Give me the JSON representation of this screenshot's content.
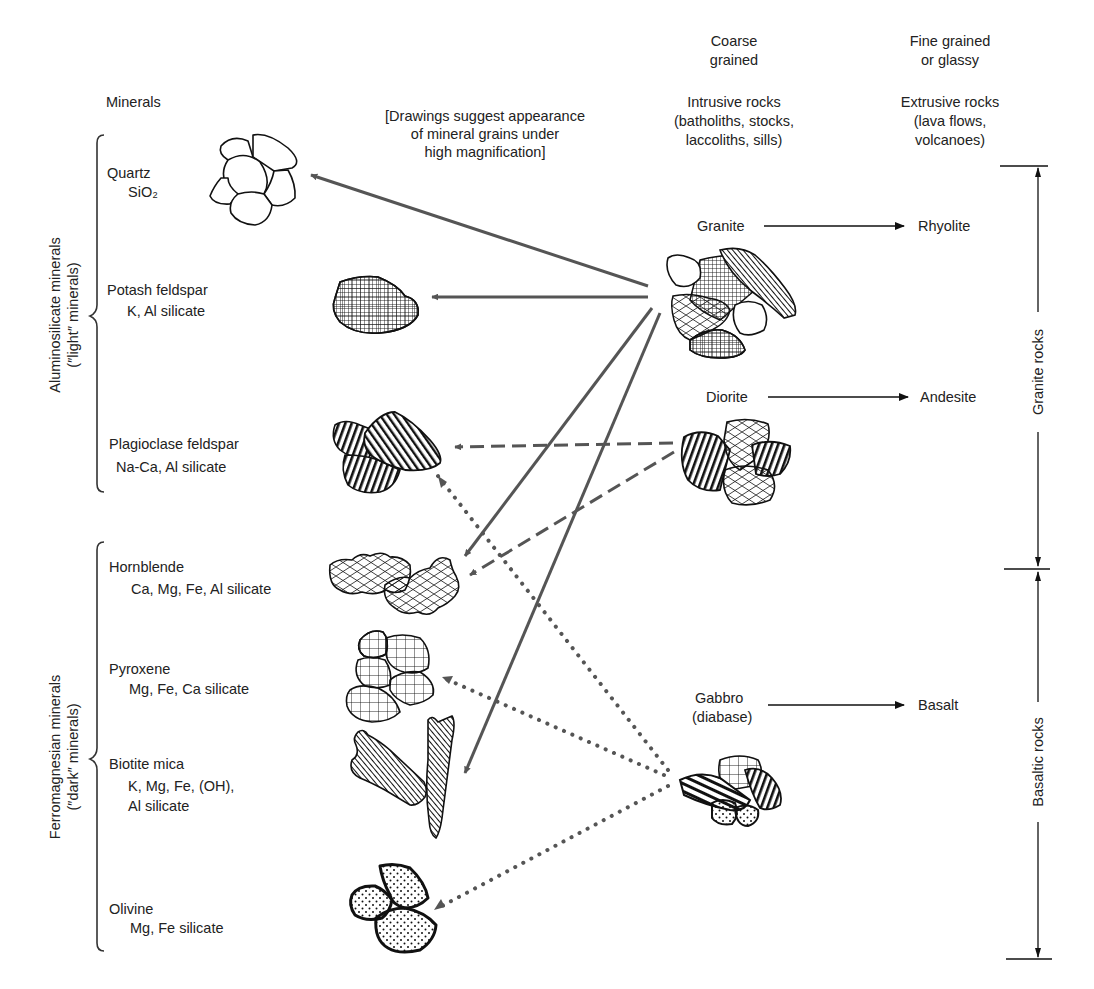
{
  "headers": {
    "minerals": "Minerals",
    "drawings_note": [
      "[Drawings suggest appearance",
      "of mineral grains under",
      "high magnification]"
    ],
    "coarse": [
      "Coarse",
      "grained"
    ],
    "intrusive": [
      "Intrusive rocks",
      "(batholiths, stocks,",
      "laccoliths, sills)"
    ],
    "fine": [
      "Fine grained",
      "or glassy"
    ],
    "extrusive": [
      "Extrusive rocks",
      "(lava flows,",
      "volcanoes)"
    ]
  },
  "groups": {
    "light": [
      "Aluminosilicate minerals",
      "(″light″ minerals)"
    ],
    "dark": [
      "Ferromagnesian minerals",
      "(″dark″ minerals)"
    ]
  },
  "minerals": [
    {
      "name": "Quartz",
      "formula": [
        "SiO₂"
      ]
    },
    {
      "name": "Potash feldspar",
      "formula": [
        "K, Al silicate"
      ]
    },
    {
      "name": "Plagioclase feldspar",
      "formula": [
        "Na-Ca, Al silicate"
      ]
    },
    {
      "name": "Hornblende",
      "formula": [
        "Ca, Mg, Fe, Al silicate"
      ]
    },
    {
      "name": "Pyroxene",
      "formula": [
        "Mg, Fe, Ca silicate"
      ]
    },
    {
      "name": "Biotite mica",
      "formula": [
        "K, Mg, Fe, (OH),",
        "Al silicate"
      ]
    },
    {
      "name": "Olivine",
      "formula": [
        "Mg, Fe silicate"
      ]
    }
  ],
  "rocks": [
    {
      "intrusive": [
        "Granite"
      ],
      "extrusive": "Rhyolite"
    },
    {
      "intrusive": [
        "Diorite"
      ],
      "extrusive": "Andesite"
    },
    {
      "intrusive": [
        "Gabbro",
        "(diabase)"
      ],
      "extrusive": "Basalt"
    }
  ],
  "ranges": {
    "granite": "Granite rocks",
    "basaltic": "Basaltic rocks"
  },
  "connections": [
    {
      "from": "Granite",
      "to": "Quartz",
      "style": "solid"
    },
    {
      "from": "Granite",
      "to": "Potash feldspar",
      "style": "solid"
    },
    {
      "from": "Granite",
      "to": "Hornblende",
      "style": "solid"
    },
    {
      "from": "Granite",
      "to": "Biotite mica",
      "style": "solid"
    },
    {
      "from": "Diorite",
      "to": "Plagioclase feldspar",
      "style": "dashed"
    },
    {
      "from": "Diorite",
      "to": "Hornblende",
      "style": "dashed"
    },
    {
      "from": "Gabbro",
      "to": "Plagioclase feldspar",
      "style": "dotted"
    },
    {
      "from": "Gabbro",
      "to": "Pyroxene",
      "style": "dotted"
    },
    {
      "from": "Gabbro",
      "to": "Olivine",
      "style": "dotted"
    }
  ],
  "colors": {
    "ink": "#111111",
    "arrow": "#555555",
    "background": "#ffffff"
  }
}
